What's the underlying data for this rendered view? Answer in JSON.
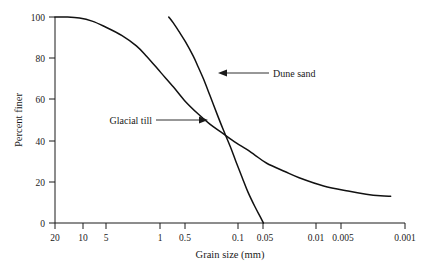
{
  "chart_data": {
    "type": "line",
    "title": "",
    "subtitle": "",
    "xlabel": "Grain size (mm)",
    "ylabel": "Percent finer",
    "x_scale": "log-reversed",
    "x_tick_labels": [
      "20",
      "10",
      "5",
      "1",
      "0.5",
      "0.1",
      "0.05",
      "0.01",
      "0.005",
      "0.001"
    ],
    "x_tick_values": [
      20,
      10,
      5,
      1,
      0.5,
      0.1,
      0.05,
      0.01,
      0.005,
      0.001
    ],
    "xlim": [
      20,
      0.001
    ],
    "y_tick_labels": [
      "0",
      "20",
      "40",
      "60",
      "80",
      "100"
    ],
    "y_tick_values": [
      0,
      20,
      40,
      60,
      80,
      100
    ],
    "ylim": [
      0,
      100
    ],
    "grid": false,
    "legend": "annotations",
    "series": [
      {
        "name": "Glacial till",
        "color": "#111111",
        "points": [
          [
            20,
            100
          ],
          [
            14,
            100
          ],
          [
            10,
            99.5
          ],
          [
            7,
            98
          ],
          [
            5,
            95.5
          ],
          [
            3,
            91
          ],
          [
            2,
            86
          ],
          [
            1.5,
            81
          ],
          [
            1,
            73
          ],
          [
            0.7,
            66
          ],
          [
            0.5,
            59
          ],
          [
            0.35,
            53
          ],
          [
            0.25,
            48
          ],
          [
            0.18,
            44
          ],
          [
            0.12,
            39
          ],
          [
            0.09,
            36
          ],
          [
            0.07,
            33
          ],
          [
            0.05,
            29
          ],
          [
            0.03,
            25
          ],
          [
            0.02,
            22
          ],
          [
            0.01,
            18
          ],
          [
            0.005,
            15.5
          ],
          [
            0.003,
            14
          ],
          [
            0.002,
            13.2
          ],
          [
            0.0015,
            13
          ]
        ]
      },
      {
        "name": "Dune sand",
        "color": "#111111",
        "points": [
          [
            0.8,
            100
          ],
          [
            0.7,
            97
          ],
          [
            0.6,
            93
          ],
          [
            0.5,
            88
          ],
          [
            0.4,
            81
          ],
          [
            0.35,
            76
          ],
          [
            0.3,
            70
          ],
          [
            0.25,
            62
          ],
          [
            0.2,
            52
          ],
          [
            0.17,
            45
          ],
          [
            0.14,
            37
          ],
          [
            0.12,
            30
          ],
          [
            0.1,
            22
          ],
          [
            0.085,
            15
          ],
          [
            0.07,
            8
          ],
          [
            0.06,
            3
          ],
          [
            0.055,
            0
          ]
        ]
      }
    ],
    "annotations": [
      {
        "text": "Dune sand",
        "points_to_series": "Dune sand",
        "arrow_direction": "left",
        "target_value": [
          0.19,
          73
        ]
      },
      {
        "text": "Glacial till",
        "points_to_series": "Glacial till",
        "arrow_direction": "right",
        "target_value": [
          0.55,
          53
        ]
      }
    ]
  }
}
